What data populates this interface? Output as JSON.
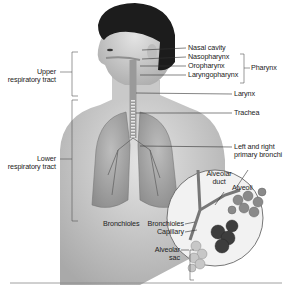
{
  "diagram": {
    "groups": {
      "upper": {
        "line1": "Upper",
        "line2": "respiratory tract"
      },
      "lower": {
        "line1": "Lower",
        "line2": "respiratory tract"
      },
      "pharynx": "Pharynx"
    },
    "labels": {
      "nasal_cavity": "Nasal cavity",
      "nasopharynx": "Nasopharynx",
      "oropharynx": "Oropharynx",
      "laryngopharynx": "Laryngopharynx",
      "larynx": "Larynx",
      "trachea": "Trachea",
      "bronchi_1": "Left and right",
      "bronchi_2": "primary bronchi",
      "bronchioles_left": "Bronchioles",
      "bronchioles_inset": "Bronchioles",
      "alveolar_duct_1": "Alveolar",
      "alveolar_duct_2": "duct",
      "alveoli": "Alveoli",
      "capillary": "Capillary",
      "alveolar_sac_1": "Alveolar",
      "alveolar_sac_2": "sac"
    },
    "colors": {
      "skin": "#d4d4d4",
      "hair": "#1a1a1a",
      "lung": "#a8a8a8",
      "line": "#333333",
      "bracket": "#555555"
    }
  }
}
